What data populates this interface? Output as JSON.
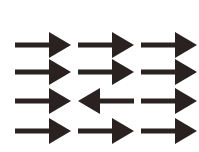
{
  "figure": {
    "color": "#2a2121",
    "rows": [
      [
        "right",
        "right",
        "right"
      ],
      [
        "right",
        "right",
        "right"
      ],
      [
        "right",
        "left",
        "right"
      ],
      [
        "right",
        "right",
        "right"
      ]
    ],
    "odd_one_out": {
      "row": 3,
      "column": 2,
      "direction": "left"
    }
  }
}
